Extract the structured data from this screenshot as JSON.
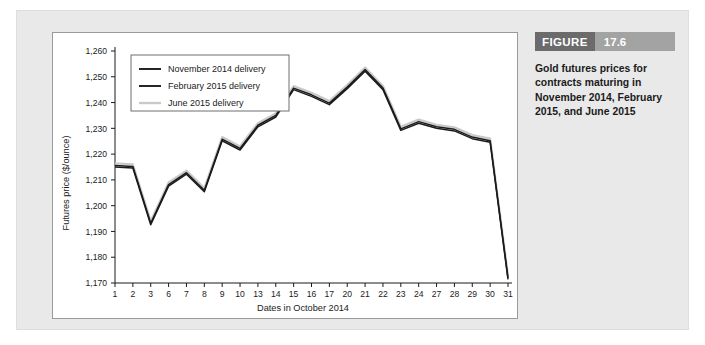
{
  "figure": {
    "badge_label": "FIGURE",
    "badge_number": "17.6",
    "caption": "Gold futures prices for contracts maturing in November 2014, February 2015, and June 2015"
  },
  "colors": {
    "panel_background": "#e9e9e9",
    "card_background": "#ffffff",
    "card_border": "#9a9a9a",
    "badge_word_bg": "#6b6b6b",
    "badge_num_bg": "#a3a3a3",
    "axis": "#1b1b1b",
    "series_november": "#1b1b1b",
    "series_february": "#1b1b1b",
    "series_june": "#c9c9c9"
  },
  "chart_data": {
    "type": "line",
    "title": "",
    "xlabel": "Dates in October 2014",
    "ylabel": "Futures price ($/ounce)",
    "categories": [
      "1",
      "2",
      "3",
      "6",
      "7",
      "8",
      "9",
      "10",
      "13",
      "14",
      "15",
      "16",
      "17",
      "20",
      "21",
      "22",
      "23",
      "24",
      "27",
      "28",
      "29",
      "30",
      "31"
    ],
    "ylim": [
      1170,
      1260
    ],
    "ytick_step": 10,
    "ytick_labels": [
      "1,170",
      "1,180",
      "1,190",
      "1,200",
      "1,210",
      "1,220",
      "1,230",
      "1,240",
      "1,250",
      "1,260"
    ],
    "grid": false,
    "legend_position": "top-left",
    "series": [
      {
        "name": "November 2014 delivery",
        "swatch": "#1b1b1b",
        "values": [
          1215.0,
          1214.6,
          1192.6,
          1207.6,
          1212.2,
          1205.4,
          1225.2,
          1221.6,
          1230.6,
          1234.4,
          1245.0,
          1242.4,
          1239.2,
          1245.4,
          1252.2,
          1245.0,
          1229.2,
          1232.0,
          1230.0,
          1229.0,
          1226.0,
          1224.6,
          1171.4
        ]
      },
      {
        "name": "February 2015 delivery",
        "swatch": "#1b1b1b",
        "values": [
          1215.6,
          1215.2,
          1193.2,
          1208.2,
          1212.8,
          1206.0,
          1225.8,
          1222.2,
          1231.2,
          1235.0,
          1245.6,
          1243.0,
          1239.8,
          1246.0,
          1252.8,
          1245.6,
          1229.8,
          1232.6,
          1230.6,
          1229.6,
          1226.6,
          1225.2,
          1172.0
        ]
      },
      {
        "name": "June 2015 delivery",
        "swatch": "#c9c9c9",
        "values": [
          1216.4,
          1216.0,
          1194.0,
          1209.0,
          1213.6,
          1206.8,
          1226.6,
          1223.0,
          1232.0,
          1235.8,
          1246.4,
          1243.8,
          1240.6,
          1246.8,
          1253.6,
          1246.4,
          1230.6,
          1233.4,
          1231.4,
          1230.4,
          1227.4,
          1226.0,
          1172.8
        ]
      }
    ]
  }
}
